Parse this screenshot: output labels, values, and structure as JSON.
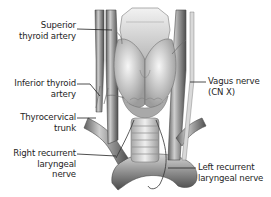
{
  "figure": {
    "colors": {
      "background": "#ffffff",
      "label_text": "#1e1e1e",
      "leader_line": "#222222",
      "illustration_dark": "#6e6e6e",
      "illustration_mid": "#a8a8a8",
      "illustration_light": "#e4e4e4"
    },
    "labels": {
      "superior_thyroid_artery": {
        "line1": "Superior",
        "line2": "thyroid artery"
      },
      "inferior_thyroid_artery": {
        "line1": "Inferior thyroid",
        "line2": "artery"
      },
      "thyrocervical_trunk": {
        "line1": "Thyrocervical",
        "line2": "trunk"
      },
      "right_recurrent_laryngeal_nerve": {
        "line1": "Right recurrent",
        "line2": "laryngeal",
        "line3": "nerve"
      },
      "vagus_nerve": {
        "line1": "Vagus nerve",
        "line2": "(CN X)"
      },
      "left_recurrent_laryngeal_nerve": {
        "line1": "Left recurrent",
        "line2": "laryngeal nerve"
      }
    }
  }
}
